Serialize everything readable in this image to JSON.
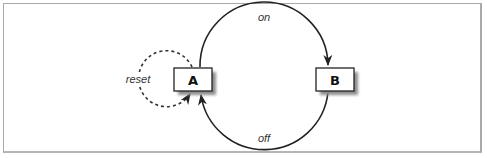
{
  "diagram": {
    "type": "state-diagram",
    "nodes": [
      {
        "id": "A",
        "label": "A"
      },
      {
        "id": "B",
        "label": "B"
      }
    ],
    "edges": [
      {
        "from": "A",
        "to": "B",
        "label": "on",
        "style": "solid"
      },
      {
        "from": "B",
        "to": "A",
        "label": "off",
        "style": "solid"
      },
      {
        "from": "A",
        "to": "A",
        "label": "reset",
        "style": "dashed"
      }
    ]
  },
  "colors": {
    "stroke": "#222222",
    "frame": "#a9a9a9",
    "shadow": "#9a9a9a",
    "node_fill": "#ffffff"
  }
}
